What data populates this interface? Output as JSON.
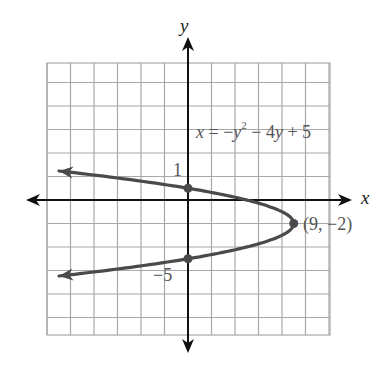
{
  "chart_data": {
    "type": "line",
    "title": "",
    "equation": "x = -y^2 - 4y + 5",
    "equation_display": {
      "lhs": "x",
      "eq": " = −",
      "var1": "y",
      "exp": "2",
      "rest1": " − 4",
      "var2": "y",
      "rest2": " + 5"
    },
    "xlabel": "x",
    "ylabel": "y",
    "xlim": [
      -12,
      12
    ],
    "ylim": [
      -12,
      12
    ],
    "grid": true,
    "grid_spacing": 2,
    "tick_labels": [
      {
        "axis": "y",
        "value": 1,
        "text": "1"
      },
      {
        "axis": "y",
        "value": -5,
        "text": "−5"
      }
    ],
    "vertex": {
      "x": 9,
      "y": -2,
      "label": "(9, −2)"
    },
    "marked_points": [
      {
        "x": 0,
        "y": 1
      },
      {
        "x": 0,
        "y": -5
      },
      {
        "x": 9,
        "y": -2
      }
    ],
    "series": [
      {
        "name": "x = -y^2 - 4y + 5",
        "points": [
          {
            "y": 2.47,
            "x": -11
          },
          {
            "y": 2,
            "x": -7
          },
          {
            "y": 1,
            "x": 0
          },
          {
            "y": 0,
            "x": 5
          },
          {
            "y": -1,
            "x": 8
          },
          {
            "y": -2,
            "x": 9
          },
          {
            "y": -3,
            "x": 8
          },
          {
            "y": -4,
            "x": 5
          },
          {
            "y": -5,
            "x": 0
          },
          {
            "y": -6,
            "x": -7
          },
          {
            "y": -6.47,
            "x": -11
          }
        ]
      }
    ],
    "colors": {
      "curve": "#4a4a4a",
      "grid": "#a8a8a8",
      "axes": "#111111",
      "text": "#555555"
    }
  }
}
